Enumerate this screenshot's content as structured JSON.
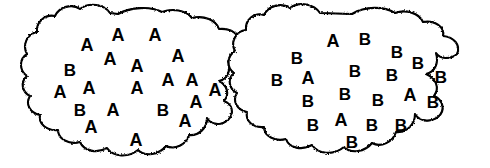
{
  "figure": {
    "type": "two-population-diagram",
    "background_color": "#ffffff",
    "ink_color": "#000000",
    "width": 490,
    "height": 168
  },
  "blobs": [
    {
      "id": "left-blob",
      "name": "Population A",
      "dominant_letter": "A",
      "minority_letter": "B",
      "counts": {
        "A": 20,
        "B": 3,
        "total": 23
      },
      "outline_color": "#000000",
      "fill_color": "#ffffff"
    },
    {
      "id": "right-blob",
      "name": "Population B",
      "dominant_letter": "B",
      "minority_letter": "A",
      "counts": {
        "A": 3,
        "B": 20,
        "total": 23
      },
      "outline_color": "#000000",
      "fill_color": "#ffffff"
    }
  ],
  "chart_data": {
    "type": "scatter",
    "title": "",
    "xlabel": "",
    "ylabel": "",
    "legend": [],
    "series": [
      {
        "name": "left-blob-letters",
        "values": [
          {
            "label": "A",
            "x": 87,
            "y": 45,
            "size": 18
          },
          {
            "label": "A",
            "x": 118,
            "y": 35,
            "size": 18
          },
          {
            "label": "A",
            "x": 155,
            "y": 35,
            "size": 18
          },
          {
            "label": "B",
            "x": 70,
            "y": 70,
            "size": 17
          },
          {
            "label": "A",
            "x": 110,
            "y": 59,
            "size": 18
          },
          {
            "label": "A",
            "x": 137,
            "y": 66,
            "size": 18
          },
          {
            "label": "A",
            "x": 178,
            "y": 56,
            "size": 18
          },
          {
            "label": "A",
            "x": 60,
            "y": 92,
            "size": 18
          },
          {
            "label": "A",
            "x": 89,
            "y": 88,
            "size": 18
          },
          {
            "label": "A",
            "x": 137,
            "y": 88,
            "size": 18
          },
          {
            "label": "A",
            "x": 168,
            "y": 80,
            "size": 18
          },
          {
            "label": "A",
            "x": 192,
            "y": 80,
            "size": 18
          },
          {
            "label": "A",
            "x": 215,
            "y": 90,
            "size": 18
          },
          {
            "label": "B",
            "x": 80,
            "y": 110,
            "size": 17
          },
          {
            "label": "A",
            "x": 113,
            "y": 110,
            "size": 18
          },
          {
            "label": "B",
            "x": 163,
            "y": 110,
            "size": 17
          },
          {
            "label": "A",
            "x": 196,
            "y": 102,
            "size": 18
          },
          {
            "label": "A",
            "x": 91,
            "y": 127,
            "size": 18
          },
          {
            "label": "A",
            "x": 185,
            "y": 121,
            "size": 18
          },
          {
            "label": "A",
            "x": 136,
            "y": 140,
            "size": 18
          }
        ]
      },
      {
        "name": "right-blob-letters",
        "values": [
          {
            "label": "A",
            "x": 333,
            "y": 41,
            "size": 18
          },
          {
            "label": "B",
            "x": 365,
            "y": 39,
            "size": 17
          },
          {
            "label": "B",
            "x": 297,
            "y": 58,
            "size": 17
          },
          {
            "label": "B",
            "x": 397,
            "y": 52,
            "size": 17
          },
          {
            "label": "B",
            "x": 418,
            "y": 63,
            "size": 17
          },
          {
            "label": "A",
            "x": 308,
            "y": 78,
            "size": 18
          },
          {
            "label": "B",
            "x": 355,
            "y": 71,
            "size": 17
          },
          {
            "label": "B",
            "x": 392,
            "y": 75,
            "size": 17
          },
          {
            "label": "B",
            "x": 441,
            "y": 77,
            "size": 17
          },
          {
            "label": "B",
            "x": 277,
            "y": 80,
            "size": 17
          },
          {
            "label": "B",
            "x": 308,
            "y": 101,
            "size": 17
          },
          {
            "label": "B",
            "x": 345,
            "y": 94,
            "size": 17
          },
          {
            "label": "B",
            "x": 378,
            "y": 100,
            "size": 17
          },
          {
            "label": "A",
            "x": 410,
            "y": 95,
            "size": 18
          },
          {
            "label": "B",
            "x": 433,
            "y": 102,
            "size": 17
          },
          {
            "label": "B",
            "x": 313,
            "y": 125,
            "size": 17
          },
          {
            "label": "A",
            "x": 341,
            "y": 120,
            "size": 18
          },
          {
            "label": "B",
            "x": 372,
            "y": 125,
            "size": 17
          },
          {
            "label": "B",
            "x": 401,
            "y": 125,
            "size": 17
          },
          {
            "label": "B",
            "x": 352,
            "y": 142,
            "size": 17
          }
        ]
      }
    ]
  }
}
